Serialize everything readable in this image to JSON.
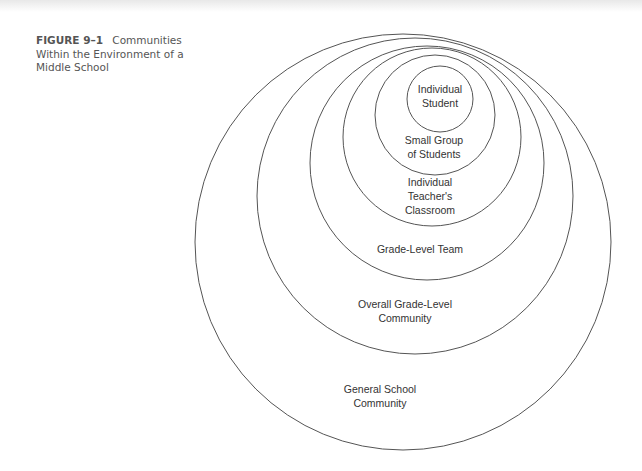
{
  "caption": {
    "figure_label": "FIGURE 9–1",
    "title": "Communities Within the Environment of a Middle School"
  },
  "diagram": {
    "type": "nested-circles",
    "stroke_color": "#555555",
    "circles": [
      {
        "id": "general",
        "label_lines": [
          "General School",
          "Community"
        ],
        "cx": 403,
        "cy": 242,
        "r": 208,
        "label_x": 380,
        "label_y": [
          393,
          407
        ]
      },
      {
        "id": "overall",
        "label_lines": [
          "Overall Grade-Level",
          "Community"
        ],
        "cx": 415,
        "cy": 196,
        "r": 158,
        "label_x": 405,
        "label_y": [
          308,
          322
        ]
      },
      {
        "id": "team",
        "label_lines": [
          "Grade-Level Team"
        ],
        "cx": 427,
        "cy": 163,
        "r": 117,
        "label_x": 420,
        "label_y": [
          253
        ]
      },
      {
        "id": "classroom",
        "label_lines": [
          "Individual",
          "Teacher's",
          "Classroom"
        ],
        "cx": 432,
        "cy": 137,
        "r": 89,
        "label_x": 430,
        "label_y": [
          186,
          200,
          214
        ]
      },
      {
        "id": "small-group",
        "label_lines": [
          "Small Group",
          "of Students"
        ],
        "cx": 435,
        "cy": 115,
        "r": 60,
        "label_x": 434,
        "label_y": [
          144,
          158
        ]
      },
      {
        "id": "student",
        "label_lines": [
          "Individual",
          "Student"
        ],
        "cx": 440,
        "cy": 99,
        "r": 33,
        "label_x": 440,
        "label_y": [
          93,
          107
        ]
      }
    ]
  }
}
